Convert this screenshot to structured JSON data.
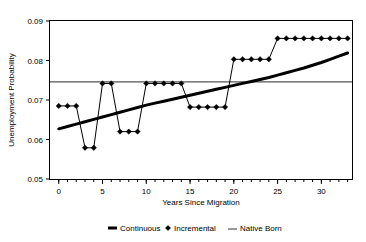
{
  "chart_data": {
    "type": "line",
    "title": "",
    "xlabel": "Years Since Migration",
    "ylabel": "Unemployment Probability",
    "xlim": [
      -1,
      33.5
    ],
    "ylim": [
      0.05,
      0.09
    ],
    "xticks": [
      0,
      5,
      10,
      15,
      20,
      25,
      30
    ],
    "xtick_labels": [
      "0",
      "5",
      "10",
      "15",
      "20",
      "25",
      "30"
    ],
    "xtick_minor_step": 1,
    "yticks": [
      0.05,
      0.06,
      0.07,
      0.08,
      0.09
    ],
    "ytick_labels": [
      "0.05",
      "0.06",
      "0.07",
      "0.08",
      "0.09"
    ],
    "grid": false,
    "legend_position": "bottom",
    "x": [
      0,
      1,
      2,
      3,
      4,
      5,
      6,
      7,
      8,
      9,
      10,
      11,
      12,
      13,
      14,
      15,
      16,
      17,
      18,
      19,
      20,
      21,
      22,
      23,
      24,
      25,
      26,
      27,
      28,
      29,
      30,
      31,
      32,
      33
    ],
    "series": [
      {
        "name": "Continuous",
        "style": "thick-line",
        "color": "#000000",
        "values": [
          0.0627,
          0.0633,
          0.0639,
          0.0645,
          0.0651,
          0.0657,
          0.0663,
          0.0669,
          0.0675,
          0.0681,
          0.0687,
          0.0692,
          0.0697,
          0.0702,
          0.0707,
          0.0712,
          0.0717,
          0.0722,
          0.0727,
          0.0732,
          0.0737,
          0.0742,
          0.0747,
          0.0752,
          0.0757,
          0.0763,
          0.0769,
          0.0775,
          0.0781,
          0.0788,
          0.0795,
          0.0803,
          0.0811,
          0.0819
        ]
      },
      {
        "name": "Incremental",
        "style": "line-with-diamond-markers",
        "color": "#000000",
        "values": [
          0.0685,
          0.0685,
          0.0685,
          0.0579,
          0.0579,
          0.0742,
          0.0742,
          0.062,
          0.062,
          0.062,
          0.0742,
          0.0742,
          0.0742,
          0.0742,
          0.0742,
          0.0682,
          0.0682,
          0.0682,
          0.0682,
          0.0682,
          0.0803,
          0.0803,
          0.0803,
          0.0803,
          0.0803,
          0.0856,
          0.0856,
          0.0856,
          0.0856,
          0.0856,
          0.0856,
          0.0856,
          0.0856,
          0.0856
        ]
      },
      {
        "name": "Native Born",
        "style": "thin-horizontal-line",
        "color": "#555555",
        "constant_value": 0.0746
      }
    ],
    "legend": [
      {
        "label": "Continuous",
        "marker": "thick-dash"
      },
      {
        "label": "Incremental",
        "marker": "diamond"
      },
      {
        "label": "Native Born",
        "marker": "thin-dash"
      }
    ]
  }
}
